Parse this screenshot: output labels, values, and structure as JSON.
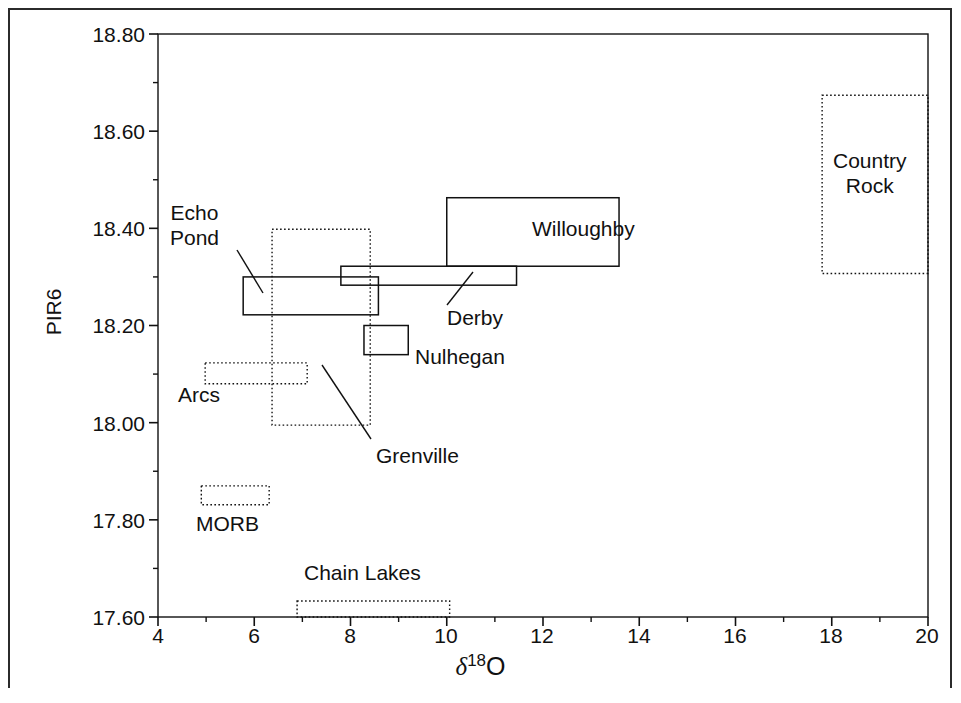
{
  "chart_data": {
    "type": "scatter",
    "title": "",
    "xlabel": "δ18O",
    "ylabel": "PIR6",
    "xlim": [
      4,
      20
    ],
    "ylim": [
      17.6,
      18.8
    ],
    "xticks": [
      "4",
      "6",
      "8",
      "10",
      "12",
      "14",
      "16",
      "18",
      "20"
    ],
    "xtick_values": [
      4,
      6,
      8,
      10,
      12,
      14,
      16,
      18,
      20
    ],
    "xminor_step": 1,
    "yticks": [
      "17.60",
      "17.80",
      "18.00",
      "18.20",
      "18.40",
      "18.60",
      "18.80"
    ],
    "ytick_values": [
      17.6,
      17.8,
      18.0,
      18.2,
      18.4,
      18.6,
      18.8
    ],
    "yminor_step": 0.1,
    "grid": false,
    "legend": "none",
    "line_color": "#111111",
    "background": "#ffffff",
    "fields": [
      {
        "name": "Echo Pond",
        "style": "solid",
        "x0": 5.77,
        "x1": 8.58,
        "y0": 18.222,
        "y1": 18.3,
        "label": "Echo\nPond",
        "label_lines": [
          "Echo",
          "Pond"
        ],
        "label_x": 170,
        "label_y": 200,
        "leader": {
          "x1": 237,
          "y1": 250,
          "x2": 263,
          "y2": 293
        }
      },
      {
        "name": "Grenville",
        "style": "dotted",
        "x0": 6.37,
        "x1": 8.41,
        "y0": 17.995,
        "y1": 18.398,
        "label": "Grenville",
        "label_lines": [
          "Grenville"
        ],
        "label_x": 376,
        "label_y": 443,
        "leader": {
          "x1": 371,
          "y1": 439,
          "x2": 322,
          "y2": 365
        }
      },
      {
        "name": "Derby",
        "style": "solid",
        "x0": 7.8,
        "x1": 11.45,
        "y0": 18.283,
        "y1": 18.322,
        "label": "Derby",
        "label_lines": [
          "Derby"
        ],
        "label_x": 447,
        "label_y": 305,
        "leader": {
          "x1": 447,
          "y1": 305,
          "x2": 473,
          "y2": 272
        }
      },
      {
        "name": "Willoughby",
        "style": "solid",
        "x0": 10.0,
        "x1": 13.58,
        "y0": 18.322,
        "y1": 18.463,
        "label": "Willoughby",
        "label_lines": [
          "Willoughby"
        ],
        "label_x": 532,
        "label_y": 216
      },
      {
        "name": "Nulhegan",
        "style": "solid",
        "x0": 8.28,
        "x1": 9.2,
        "y0": 18.14,
        "y1": 18.2,
        "label": "Nulhegan",
        "label_lines": [
          "Nulhegan"
        ],
        "label_x": 415,
        "label_y": 344
      },
      {
        "name": "Arcs",
        "style": "dotted",
        "x0": 4.98,
        "x1": 7.1,
        "y0": 18.08,
        "y1": 18.123,
        "label": "Arcs",
        "label_lines": [
          "Arcs"
        ],
        "label_x": 178,
        "label_y": 382
      },
      {
        "name": "MORB",
        "style": "dotted",
        "x0": 4.9,
        "x1": 6.31,
        "y0": 17.831,
        "y1": 17.87,
        "label": "MORB",
        "label_lines": [
          "MORB"
        ],
        "label_x": 196,
        "label_y": 511
      },
      {
        "name": "Chain Lakes",
        "style": "dotted",
        "x0": 6.89,
        "x1": 10.06,
        "y0": 17.6,
        "y1": 17.633,
        "label": "Chain Lakes",
        "label_lines": [
          "Chain Lakes"
        ],
        "label_x": 304,
        "label_y": 560
      },
      {
        "name": "Country Rock",
        "style": "dotted",
        "x0": 17.8,
        "x1": 20.0,
        "y0": 18.307,
        "y1": 18.674,
        "label": "Country Rock",
        "label_lines": [
          "Country",
          "Rock"
        ],
        "label_x": 833,
        "label_y": 148
      }
    ]
  },
  "axes": {
    "y_title": "PIR6",
    "x_title_delta": "δ",
    "x_title_sup": "18",
    "x_title_o": "O"
  }
}
